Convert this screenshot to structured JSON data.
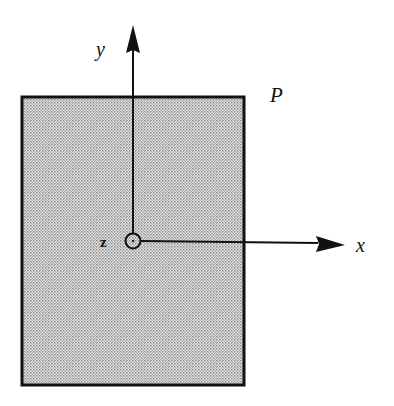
{
  "diagram": {
    "plate_label": "P",
    "axes": {
      "x_label": "x",
      "y_label": "y",
      "z_label": "z"
    },
    "colors": {
      "line": "#111111",
      "fill_dots": "#9a9a9a",
      "fill_bg": "#e4e4e4"
    }
  }
}
